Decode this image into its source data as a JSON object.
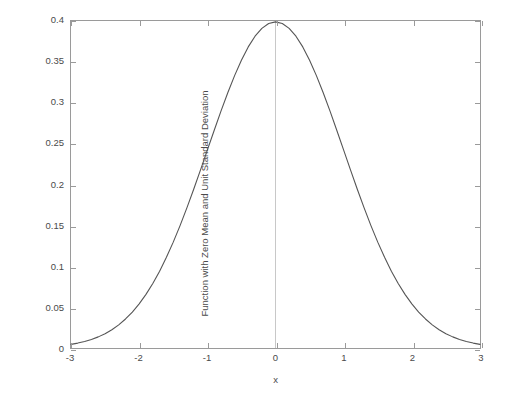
{
  "figure": {
    "background_color": "#ffffff",
    "axis_color": "#9a9a9a",
    "text_color": "#4a4a4a",
    "curve_color": "#555555",
    "reference_line_color": "#c8c8c8"
  },
  "chart_data": {
    "type": "line",
    "title": "",
    "xlabel": "x",
    "ylabel": "Function with Zero Mean and Unit Standard Deviation",
    "xlim": [
      -3,
      3
    ],
    "ylim": [
      0,
      0.4
    ],
    "grid": false,
    "legend": null,
    "x_ticks": [
      "-3",
      "-2",
      "-1",
      "0",
      "1",
      "2",
      "3"
    ],
    "x_tick_values": [
      -3,
      -2,
      -1,
      0,
      1,
      2,
      3
    ],
    "y_ticks": [
      "0",
      "0.05",
      "0.1",
      "0.15",
      "0.2",
      "0.25",
      "0.3",
      "0.35",
      "0.4"
    ],
    "y_tick_values": [
      0,
      0.05,
      0.1,
      0.15,
      0.2,
      0.25,
      0.3,
      0.35,
      0.4
    ],
    "annotations": [
      {
        "name": "vertical-reference-line-at-zero",
        "x": 0,
        "y_from": 0,
        "y_to": 0.4
      }
    ],
    "series": [
      {
        "name": "standard normal pdf",
        "x": [
          -3,
          -2.9,
          -2.8,
          -2.7,
          -2.6,
          -2.5,
          -2.4,
          -2.3,
          -2.2,
          -2.1,
          -2,
          -1.9,
          -1.8,
          -1.7,
          -1.6,
          -1.5,
          -1.4,
          -1.3,
          -1.2,
          -1.1,
          -1,
          -0.9,
          -0.8,
          -0.7,
          -0.6,
          -0.5,
          -0.4,
          -0.3,
          -0.2,
          -0.1,
          0,
          0.1,
          0.2,
          0.3,
          0.4,
          0.5,
          0.6,
          0.7,
          0.8,
          0.9,
          1,
          1.1,
          1.2,
          1.3,
          1.4,
          1.5,
          1.6,
          1.7,
          1.8,
          1.9,
          2,
          2.1,
          2.2,
          2.3,
          2.4,
          2.5,
          2.6,
          2.7,
          2.8,
          2.9,
          3
        ],
        "values": [
          0.0044,
          0.006,
          0.0079,
          0.0104,
          0.0136,
          0.0175,
          0.0224,
          0.0283,
          0.0355,
          0.044,
          0.054,
          0.0656,
          0.079,
          0.094,
          0.1109,
          0.1295,
          0.1497,
          0.1714,
          0.1942,
          0.2179,
          0.242,
          0.2661,
          0.2897,
          0.3123,
          0.3332,
          0.352,
          0.3683,
          0.3814,
          0.391,
          0.397,
          0.3989,
          0.397,
          0.391,
          0.3814,
          0.3683,
          0.352,
          0.3332,
          0.3123,
          0.2897,
          0.2661,
          0.242,
          0.2179,
          0.1942,
          0.1714,
          0.1497,
          0.1295,
          0.1109,
          0.094,
          0.079,
          0.0656,
          0.054,
          0.044,
          0.0355,
          0.0283,
          0.0224,
          0.0175,
          0.0136,
          0.0104,
          0.0079,
          0.006,
          0.0044
        ]
      }
    ]
  }
}
